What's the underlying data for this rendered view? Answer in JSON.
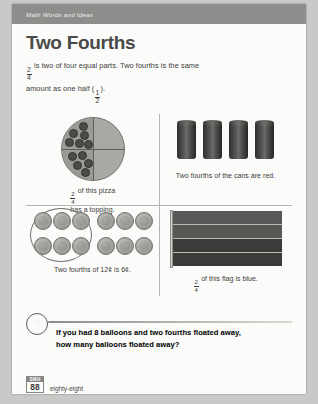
{
  "header": {
    "running_head": "Math Words and Ideas"
  },
  "title": "Two Fourths",
  "intro": {
    "line1_fraction": {
      "numerator": "2",
      "denominator": "4"
    },
    "line1_text": " is two of four equal parts. Two fourths is the same",
    "line2_prefix": "amount as one half (",
    "line2_fraction": {
      "numerator": "1",
      "denominator": "2"
    },
    "line2_suffix": ")."
  },
  "panels": {
    "pizza": {
      "caption_fraction": {
        "numerator": "2",
        "denominator": "4"
      },
      "caption_line1": " of this pizza",
      "caption_line2": "has a topping.",
      "topping_count": 11,
      "shaded_halves": 2,
      "total_parts": 4
    },
    "cans": {
      "caption": "Two fourths of the cans are red.",
      "total": 4,
      "red_count": 2,
      "color": "#4a4a48"
    },
    "coins": {
      "caption": "Two fourths of 12¢ is 6¢.",
      "total": 12,
      "circled": 6,
      "rows": 2,
      "columns": 6
    },
    "flag": {
      "caption_fraction": {
        "numerator": "2",
        "denominator": "4"
      },
      "caption_text": " of this flag is blue.",
      "stripes": 4,
      "blue_stripes": 2,
      "blue_color": "#3b3b39",
      "other_color": "#575755"
    }
  },
  "question": {
    "icon": "question-mark-icon",
    "line1": "If you had 8 balloons and two fourths floated away,",
    "line2": "how many balloons floated away?"
  },
  "footer": {
    "tab_label": "SMH",
    "page_number": "88",
    "page_word": "eighty-eight"
  }
}
